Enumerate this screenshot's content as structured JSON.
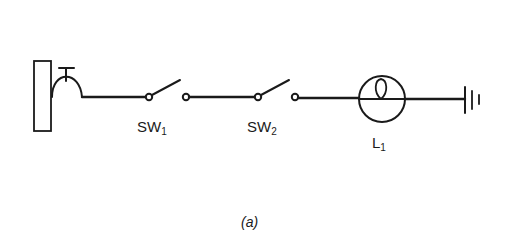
{
  "diagram": {
    "caption": "(a)",
    "stroke_color": "#1a1a1a",
    "background": "#ffffff",
    "components": [
      {
        "id": "source",
        "type": "wall-socket-plug",
        "label": ""
      },
      {
        "id": "sw1",
        "type": "switch-open",
        "label_main": "SW",
        "label_sub": "1"
      },
      {
        "id": "sw2",
        "type": "switch-open",
        "label_main": "SW",
        "label_sub": "2"
      },
      {
        "id": "l1",
        "type": "lamp",
        "label_main": "L",
        "label_sub": "1"
      },
      {
        "id": "ground",
        "type": "earth-ground",
        "label": ""
      }
    ],
    "connections": [
      "source-sw1",
      "sw1-sw2",
      "sw2-l1",
      "l1-ground"
    ]
  }
}
